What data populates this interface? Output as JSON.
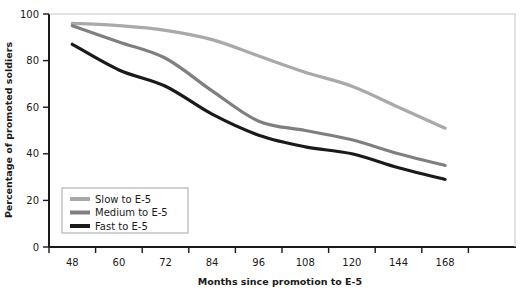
{
  "chart_data": {
    "type": "line",
    "title": "",
    "xlabel": "Months since promotion to E-5",
    "ylabel": "Percentage of promoted soldiers",
    "categories": [
      "48",
      "60",
      "72",
      "84",
      "96",
      "108",
      "120",
      "144",
      "168"
    ],
    "x_tick_labels": [
      "48",
      "60",
      "72",
      "84",
      "96",
      "108",
      "120",
      "144",
      "168"
    ],
    "y_tick_labels": [
      "0",
      "20",
      "40",
      "60",
      "80",
      "100"
    ],
    "y_ticks": [
      0,
      20,
      40,
      60,
      80,
      100
    ],
    "ylim": [
      0,
      100
    ],
    "grid": false,
    "legend_position": "bottom-left",
    "series": [
      {
        "name": "Slow to E-5",
        "color": "#a9a9a9",
        "values": [
          96,
          95,
          93,
          89,
          82,
          75,
          69,
          60,
          51
        ]
      },
      {
        "name": "Medium to E-5",
        "color": "#7f7f7f",
        "values": [
          95,
          88,
          81,
          67,
          54,
          50,
          46,
          40,
          35
        ]
      },
      {
        "name": "Fast to E-5",
        "color": "#1a1a1a",
        "values": [
          87,
          76,
          69,
          57,
          48,
          43,
          40,
          34,
          29
        ]
      }
    ]
  },
  "legend": {
    "items": [
      {
        "label": "Slow to E-5",
        "color": "#a9a9a9"
      },
      {
        "label": "Medium to E-5",
        "color": "#7f7f7f"
      },
      {
        "label": "Fast to E-5",
        "color": "#1a1a1a"
      }
    ]
  },
  "axes": {
    "x_title": "Months since promotion to E-5",
    "y_title": "Percentage of promoted soldiers"
  }
}
